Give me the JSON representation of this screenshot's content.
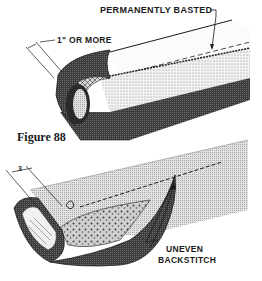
{
  "figure": {
    "caption": "Figure 88",
    "top_illustration": {
      "labels": {
        "basted": "PERMANENTLY BASTED",
        "width": "1\" OR MORE"
      }
    },
    "bottom_illustration": {
      "labels": {
        "dimension": "3",
        "stitch": "UNEVEN",
        "stitch_line2": "BACKSTITCH"
      }
    },
    "colors": {
      "ink": "#1a1a1a",
      "paper": "#ffffff",
      "dark_fabric": "#4a4a4a",
      "light_fabric": "#d6d6d6",
      "speckle": "#eeeeee"
    }
  }
}
